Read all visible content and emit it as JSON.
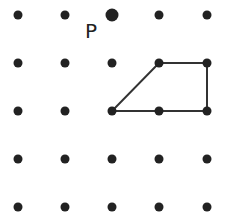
{
  "diagram": {
    "type": "dot-grid",
    "rows": 5,
    "cols": 5,
    "dot_color": "#222222",
    "line_color": "#333333",
    "grid_x": [
      18,
      65,
      112,
      159,
      207
    ],
    "grid_y": [
      15,
      63,
      111,
      159,
      207
    ],
    "point_label": {
      "text": "P",
      "grid_col": 2,
      "grid_row": 0
    },
    "shape": {
      "name": "trapezoid",
      "vertices_grid": [
        [
          3,
          1
        ],
        [
          4,
          1
        ],
        [
          4,
          2
        ],
        [
          2,
          2
        ]
      ]
    }
  }
}
